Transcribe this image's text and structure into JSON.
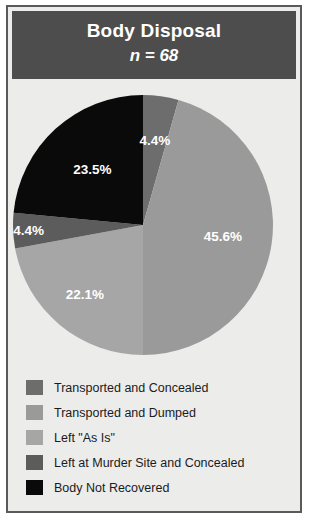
{
  "header": {
    "title": "Body Disposal",
    "subtitle": "n = 68"
  },
  "chart_data": {
    "type": "pie",
    "title": "Body Disposal",
    "subtitle": "n = 68",
    "n": 68,
    "unit": "%",
    "start_angle_deg": 0,
    "direction": "clockwise",
    "legend_position": "bottom",
    "grid": false,
    "categories": [
      "Transported and Concealed",
      "Transported and Dumped",
      "Left \"As Is\"",
      "Left at Murder Site and Concealed",
      "Body Not Recovered"
    ],
    "values": [
      4.4,
      45.6,
      22.1,
      4.4,
      23.5
    ],
    "data_labels": [
      "4.4%",
      "45.6%",
      "22.1%",
      "4.4%",
      "23.5%"
    ],
    "colors": [
      "#6d6d6d",
      "#9a9a9a",
      "#a6a6a6",
      "#5c5c5c",
      "#0a0a0a"
    ]
  },
  "slices": [
    {
      "label": "4.4%",
      "name": "transported-and-concealed"
    },
    {
      "label": "45.6%",
      "name": "transported-and-dumped"
    },
    {
      "label": "22.1%",
      "name": "left-as-is"
    },
    {
      "label": "4.4%",
      "name": "left-at-murder-site-and-concealed"
    },
    {
      "label": "23.5%",
      "name": "body-not-recovered"
    }
  ],
  "legend": {
    "items": [
      {
        "label": "Transported and Concealed",
        "color": "#6d6d6d"
      },
      {
        "label": "Transported and Dumped",
        "color": "#9a9a9a"
      },
      {
        "label": "Left \"As Is\"",
        "color": "#a6a6a6"
      },
      {
        "label": "Left at Murder Site and Concealed",
        "color": "#5c5c5c"
      },
      {
        "label": "Body Not Recovered",
        "color": "#0a0a0a"
      }
    ]
  }
}
